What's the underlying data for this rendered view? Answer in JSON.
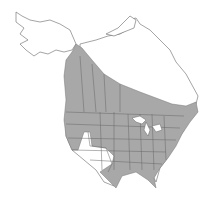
{
  "map": {
    "type": "species range map",
    "region": "North America",
    "colors": {
      "background": "#ffffff",
      "range_fill": "#a8a8a8",
      "outline": "#555555",
      "water": "#ffffff"
    },
    "legend": []
  }
}
